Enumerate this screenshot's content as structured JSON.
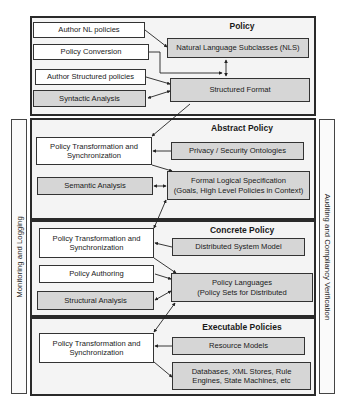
{
  "side_panels": {
    "left": "Monitoring and Logging",
    "right": "Auditing and Compliancy Verification"
  },
  "sections": [
    {
      "title": "Policy",
      "left_boxes": [
        "Author NL policies",
        "Policy Conversion",
        "Author Structured policies",
        "Syntactic Analysis"
      ],
      "right_boxes": [
        "Natural Language Subclasses (NLS)",
        "Structured Format"
      ]
    },
    {
      "title": "Abstract Policy",
      "left_boxes": [
        "Policy Transformation and Synchronization",
        "Semantic Analysis"
      ],
      "right_boxes": [
        "Privacy / Security Ontologies",
        "Formal Logical Specification (Goals, High Level Policies in Context)"
      ],
      "right_box_lines": [
        "Formal Logical Specification",
        "(Goals, High Level Policies in Context)"
      ]
    },
    {
      "title": "Concrete Policy",
      "left_boxes": [
        "Policy Transformation and Synchronization",
        "Policy Authoring",
        "Structural Analysis"
      ],
      "right_boxes": [
        "Distributed System Model",
        "Policy Languages (Policy Sets for Distributed"
      ],
      "right_box_lines": [
        "Policy Languages",
        "(Policy Sets for Distributed"
      ]
    },
    {
      "title": "Executable Policies",
      "left_boxes": [
        "Policy Transformation and Synchronization"
      ],
      "right_boxes": [
        "Resource Models",
        "Databases, XML Stores, Rule Engines, State Machines, etc"
      ],
      "right_box_lines": [
        "Databases, XML Stores, Rule",
        "Engines, State Machines, etc"
      ]
    }
  ]
}
